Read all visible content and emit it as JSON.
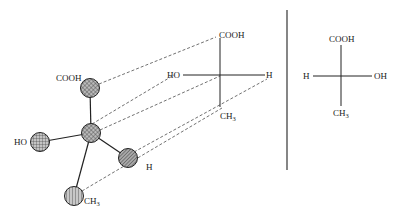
{
  "diagram": {
    "model_3d": {
      "groups": {
        "top": "COOH",
        "left": "HO",
        "right": "H",
        "bottom": "CH",
        "bottom_subscript": "3"
      }
    },
    "fischer_left": {
      "top": "COOH",
      "left": "HO",
      "right": "H",
      "bottom": "CH",
      "bottom_subscript": "3"
    },
    "fischer_right": {
      "top": "COOH",
      "left": "H",
      "right": "OH",
      "bottom": "CH",
      "bottom_subscript": "3"
    },
    "colors": {
      "line": "#333333",
      "sphere_fill": "#9a9a9a",
      "background": "#ffffff"
    }
  }
}
